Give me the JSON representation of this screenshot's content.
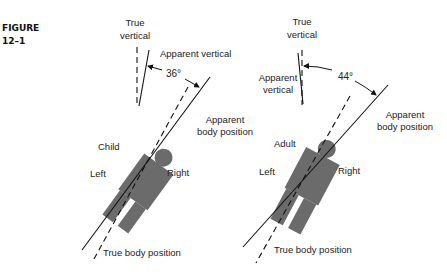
{
  "figure": {
    "label_line1": "FIGURE",
    "label_line2": "12–1"
  },
  "panels": [
    {
      "subject": "Child",
      "true_vertical": [
        "True",
        "vertical"
      ],
      "apparent_vertical": "Apparent vertical",
      "angle": "36°",
      "apparent_body_position": [
        "Apparent",
        "body position"
      ],
      "left": "Left",
      "right": "Right",
      "true_body_position": "True body position"
    },
    {
      "subject": "Adult",
      "true_vertical": [
        "True",
        "vertical"
      ],
      "apparent_vertical": [
        "Apparent",
        "vertical"
      ],
      "angle": "44°",
      "apparent_body_position": [
        "Apparent",
        "body position"
      ],
      "left": "Left",
      "right": "Right",
      "true_body_position": "True body position"
    }
  ],
  "colors": {
    "figure_fill": "#6b6b6b",
    "line": "#111111",
    "text": "#222222"
  }
}
